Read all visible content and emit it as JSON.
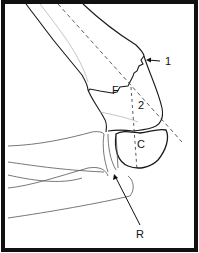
{
  "figure": {
    "labels": {
      "one": "1",
      "two": "2",
      "f": "F",
      "c": "C",
      "r": "R"
    },
    "colors": {
      "line": "#1a1a1a",
      "faint_line": "#8a8a8a",
      "border": "#111111",
      "background": "#ffffff"
    }
  }
}
